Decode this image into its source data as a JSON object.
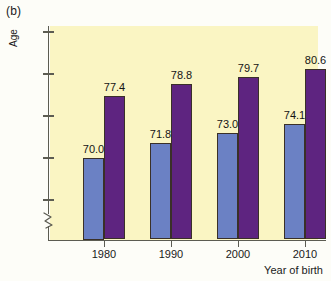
{
  "figure": {
    "panel_label": "(b)",
    "background_color": "#fdfdf8",
    "plot_background_color": "#faf5c3"
  },
  "chart_data": {
    "type": "bar",
    "title": "",
    "subtitle": "",
    "panel": "(b)",
    "xlabel": "Year of birth",
    "ylabel": "Age",
    "categories": [
      "1980",
      "1990",
      "2000",
      "2010"
    ],
    "series": [
      {
        "name": "series-1",
        "color": "#6b81c4",
        "values": [
          70.0,
          71.8,
          73.0,
          74.1
        ],
        "labels": [
          "70.0",
          "71.8",
          "73.0",
          "74.1"
        ]
      },
      {
        "name": "series-2",
        "color": "#5e2480",
        "values": [
          77.4,
          78.8,
          79.7,
          80.6
        ],
        "labels": [
          "77.4",
          "78.8",
          "79.7",
          "80.6"
        ]
      }
    ],
    "ylim": [
      63.5,
      86.5
    ],
    "yticks": [
      65,
      70,
      75,
      80,
      85
    ],
    "ytick_labels": [
      "65",
      "70",
      "75",
      "80",
      "85"
    ],
    "y_axis_break": true,
    "y_origin_label": "0",
    "grid": false,
    "legend": null,
    "data_labels": true
  }
}
